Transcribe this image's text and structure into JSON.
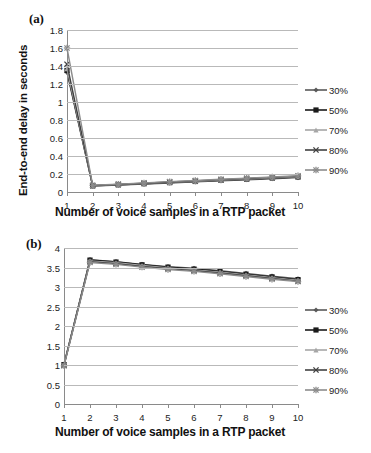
{
  "figure": {
    "panels": [
      {
        "label": "(a)",
        "xlabel": "Number of voice samples in a RTP packet",
        "ylabel": "End-to-end delay in seconds"
      },
      {
        "label": "(b)",
        "xlabel": "Number of voice samples in a RTP packet",
        "ylabel": "MOS"
      }
    ]
  },
  "chart_data": [
    {
      "type": "line",
      "title": "(a)",
      "xlabel": "Number of voice samples in a RTP packet",
      "ylabel": "End-to-end delay in seconds",
      "x": [
        1,
        2,
        3,
        4,
        5,
        6,
        7,
        8,
        9,
        10
      ],
      "xticklabels": [
        "1",
        "2",
        "3",
        "4",
        "5",
        "6",
        "7",
        "8",
        "9",
        "10"
      ],
      "yticklabels": [
        "0",
        "0.2",
        "0.4",
        "0.6",
        "0.8",
        "1",
        "1.2",
        "1.4",
        "1.6",
        "1.8"
      ],
      "ylim": [
        0,
        1.8
      ],
      "ytick_step": 0.2,
      "xlim": [
        1,
        10
      ],
      "grid": "horizontal",
      "legend_position": "right",
      "series": [
        {
          "name": "30%",
          "marker": "diamond",
          "color": "#595959",
          "values": [
            1.33,
            0.065,
            0.077,
            0.088,
            0.1,
            0.112,
            0.124,
            0.136,
            0.148,
            0.16
          ]
        },
        {
          "name": "50%",
          "marker": "square",
          "color": "#1a1a1a",
          "values": [
            1.35,
            0.068,
            0.08,
            0.092,
            0.104,
            0.117,
            0.129,
            0.141,
            0.154,
            0.166
          ]
        },
        {
          "name": "70%",
          "marker": "triangle",
          "color": "#a6a6a6",
          "values": [
            1.37,
            0.07,
            0.083,
            0.095,
            0.108,
            0.12,
            0.133,
            0.145,
            0.158,
            0.17
          ]
        },
        {
          "name": "80%",
          "marker": "cross",
          "color": "#404040",
          "values": [
            1.42,
            0.072,
            0.085,
            0.098,
            0.111,
            0.124,
            0.137,
            0.15,
            0.162,
            0.175
          ]
        },
        {
          "name": "90%",
          "marker": "star",
          "color": "#8c8c8c",
          "values": [
            1.6,
            0.075,
            0.088,
            0.101,
            0.115,
            0.128,
            0.141,
            0.154,
            0.167,
            0.18
          ]
        }
      ]
    },
    {
      "type": "line",
      "title": "(b)",
      "xlabel": "Number of voice samples in a RTP packet",
      "ylabel": "MOS",
      "x": [
        1,
        2,
        3,
        4,
        5,
        6,
        7,
        8,
        9,
        10
      ],
      "xticklabels": [
        "1",
        "2",
        "3",
        "4",
        "5",
        "6",
        "7",
        "8",
        "9",
        "10"
      ],
      "yticklabels": [
        "0",
        "0.5",
        "1",
        "1.5",
        "2",
        "2.5",
        "3",
        "3.5",
        "4"
      ],
      "ylim": [
        0,
        4
      ],
      "ytick_step": 0.5,
      "xlim": [
        1,
        10
      ],
      "grid": "horizontal",
      "legend_position": "right",
      "series": [
        {
          "name": "30%",
          "marker": "diamond",
          "color": "#595959",
          "values": [
            1.02,
            3.7,
            3.65,
            3.58,
            3.52,
            3.48,
            3.42,
            3.35,
            3.28,
            3.21
          ]
        },
        {
          "name": "50%",
          "marker": "square",
          "color": "#1a1a1a",
          "values": [
            1.01,
            3.69,
            3.64,
            3.57,
            3.51,
            3.46,
            3.4,
            3.33,
            3.26,
            3.19
          ]
        },
        {
          "name": "70%",
          "marker": "triangle",
          "color": "#a6a6a6",
          "values": [
            1.0,
            3.67,
            3.62,
            3.55,
            3.49,
            3.44,
            3.38,
            3.31,
            3.24,
            3.17
          ]
        },
        {
          "name": "80%",
          "marker": "cross",
          "color": "#404040",
          "values": [
            0.99,
            3.65,
            3.6,
            3.53,
            3.47,
            3.42,
            3.36,
            3.29,
            3.22,
            3.15
          ]
        },
        {
          "name": "90%",
          "marker": "star",
          "color": "#8c8c8c",
          "values": [
            0.98,
            3.63,
            3.58,
            3.51,
            3.45,
            3.4,
            3.34,
            3.27,
            3.2,
            3.14
          ]
        }
      ]
    }
  ]
}
